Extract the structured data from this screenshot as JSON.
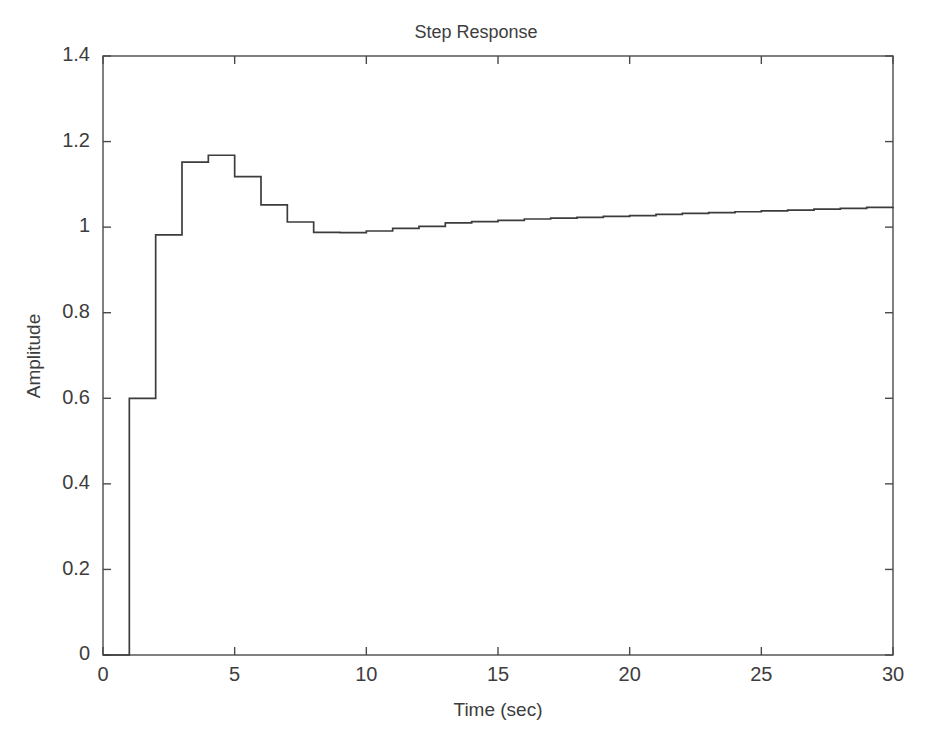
{
  "chart_data": {
    "type": "line",
    "subtype": "staircase-step-response",
    "title": "Step Response",
    "xlabel": "Time (sec)",
    "ylabel": "Amplitude",
    "xlim": [
      0,
      30
    ],
    "ylim": [
      0,
      1.4
    ],
    "xticks": [
      0,
      5,
      10,
      15,
      20,
      25,
      30
    ],
    "xticklabels": [
      "0",
      "5",
      "10",
      "15",
      "20",
      "25",
      "30"
    ],
    "yticks": [
      0,
      0.2,
      0.4,
      0.6,
      0.8,
      1,
      1.2,
      1.4
    ],
    "yticklabels": [
      "0",
      "0.2",
      "0.4",
      "0.6",
      "0.8",
      "1",
      "1.2",
      "1.4"
    ],
    "grid": false,
    "legend": null,
    "line_color": "#3c3c3c",
    "axes_color": "#4a4a4a",
    "background_color": "#ffffff",
    "series": [
      {
        "name": "Step Response",
        "x": [
          0,
          1,
          2,
          3,
          4,
          5,
          6,
          7,
          8,
          9,
          10,
          11,
          12,
          13,
          14,
          15,
          16,
          17,
          18,
          19,
          20,
          21,
          22,
          23,
          24,
          25,
          26,
          27,
          28,
          29,
          30
        ],
        "values": [
          0,
          0.6,
          0.982,
          1.152,
          1.168,
          1.118,
          1.052,
          1.012,
          0.988,
          0.987,
          0.991,
          0.997,
          1.002,
          1.01,
          1.013,
          1.016,
          1.019,
          1.021,
          1.023,
          1.025,
          1.027,
          1.03,
          1.032,
          1.034,
          1.036,
          1.038,
          1.04,
          1.042,
          1.044,
          1.046,
          1.047
        ]
      }
    ],
    "annotations": {
      "initial_value": 0,
      "first_step_time": 1,
      "first_step_value": 0.6,
      "peak_value": 1.168,
      "peak_time": 4,
      "min_after_peak": 0.987,
      "min_time": 9,
      "final_value": 1.047
    }
  }
}
